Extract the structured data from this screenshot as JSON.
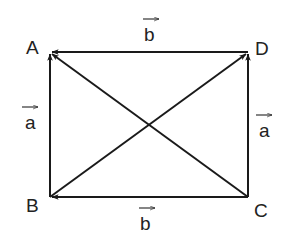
{
  "diagram": {
    "type": "vector-parallelogram",
    "stroke_color": "#1a1a1a",
    "text_color": "#222222",
    "background": "#ffffff",
    "points": {
      "A": {
        "label": "A",
        "x": 50,
        "y": 52
      },
      "B": {
        "label": "B",
        "x": 50,
        "y": 197
      },
      "C": {
        "label": "C",
        "x": 248,
        "y": 197
      },
      "D": {
        "label": "D",
        "x": 248,
        "y": 52
      }
    },
    "edges": [
      {
        "from": "D",
        "to": "A",
        "vector_label": "b"
      },
      {
        "from": "B",
        "to": "A",
        "vector_label": "a"
      },
      {
        "from": "C",
        "to": "D",
        "vector_label": "a"
      },
      {
        "from": "C",
        "to": "B",
        "vector_label": "b"
      },
      {
        "from": "C",
        "to": "A",
        "vector_label": ""
      },
      {
        "from": "B",
        "to": "D",
        "vector_label": ""
      }
    ],
    "vector_labels": {
      "top": "b",
      "left": "a",
      "right": "a",
      "bottom": "b"
    }
  }
}
